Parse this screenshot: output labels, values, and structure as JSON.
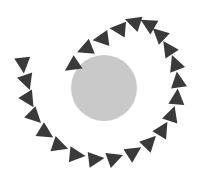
{
  "canvas": {
    "width": 202,
    "height": 188,
    "background_color": "#ffffff",
    "title": "Spiral of rotating triangular arrowheads around a grey disc"
  },
  "center_disc": {
    "shape_name": "grey-circle",
    "cx": 104,
    "cy": 88,
    "r": 33,
    "fill_color": "#c9c9c9"
  },
  "markers": {
    "shape": "triangle",
    "fill_color": "#3a3a3a",
    "count": 24,
    "size": 15,
    "description": "Triangular arrowheads arranged on an outward spiral, each rotated tangent to the path",
    "items": [
      {
        "index": 1,
        "cx": 72,
        "cy": 66,
        "rotation": 236,
        "size": 16
      },
      {
        "index": 2,
        "cx": 85,
        "cy": 49,
        "rotation": 248,
        "size": 16
      },
      {
        "index": 3,
        "cx": 101,
        "cy": 39,
        "rotation": 262,
        "size": 16
      },
      {
        "index": 4,
        "cx": 118,
        "cy": 29,
        "rotation": 275,
        "size": 16
      },
      {
        "index": 5,
        "cx": 133,
        "cy": 22,
        "rotation": 288,
        "size": 16
      },
      {
        "index": 6,
        "cx": 148,
        "cy": 24,
        "rotation": 300,
        "size": 16
      },
      {
        "index": 7,
        "cx": 159,
        "cy": 34,
        "rotation": 313,
        "size": 16
      },
      {
        "index": 8,
        "cx": 168,
        "cy": 48,
        "rotation": 326,
        "size": 16
      },
      {
        "index": 9,
        "cx": 175,
        "cy": 63,
        "rotation": 339,
        "size": 16
      },
      {
        "index": 10,
        "cx": 178,
        "cy": 80,
        "rotation": 352,
        "size": 16
      },
      {
        "index": 11,
        "cx": 177,
        "cy": 97,
        "rotation": 5,
        "size": 16
      },
      {
        "index": 12,
        "cx": 172,
        "cy": 114,
        "rotation": 18,
        "size": 16
      },
      {
        "index": 13,
        "cx": 163,
        "cy": 129,
        "rotation": 31,
        "size": 16
      },
      {
        "index": 14,
        "cx": 150,
        "cy": 142,
        "rotation": 44,
        "size": 16
      },
      {
        "index": 15,
        "cx": 134,
        "cy": 152,
        "rotation": 57,
        "size": 16
      },
      {
        "index": 16,
        "cx": 115,
        "cy": 158,
        "rotation": 70,
        "size": 16
      },
      {
        "index": 17,
        "cx": 96,
        "cy": 159,
        "rotation": 83,
        "size": 16
      },
      {
        "index": 18,
        "cx": 77,
        "cy": 155,
        "rotation": 96,
        "size": 16
      },
      {
        "index": 19,
        "cx": 60,
        "cy": 146,
        "rotation": 109,
        "size": 16
      },
      {
        "index": 20,
        "cx": 46,
        "cy": 133,
        "rotation": 122,
        "size": 16
      },
      {
        "index": 21,
        "cx": 35,
        "cy": 117,
        "rotation": 135,
        "size": 16
      },
      {
        "index": 22,
        "cx": 29,
        "cy": 100,
        "rotation": 148,
        "size": 16
      },
      {
        "index": 23,
        "cx": 27,
        "cy": 82,
        "rotation": 161,
        "size": 16
      },
      {
        "index": 24,
        "cx": 23,
        "cy": 65,
        "rotation": 174,
        "size": 16
      }
    ]
  }
}
